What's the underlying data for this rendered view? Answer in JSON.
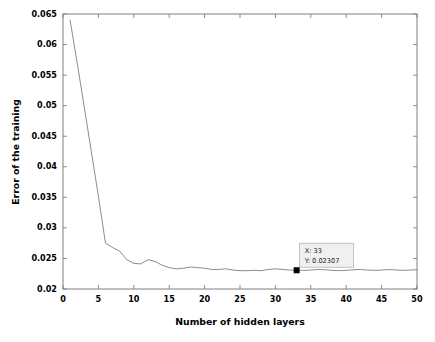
{
  "figure": {
    "background": "#ffffff",
    "plot_box": {
      "left": 63,
      "top": 14,
      "right": 417,
      "bottom": 289
    },
    "axis_color": "#808080",
    "line_color": "#8c8c8c",
    "marker_color": "#000000"
  },
  "datatip": {
    "x_label": "X: 33",
    "y_label": "Y: 0.02307",
    "box_fill": "#f0f0f0",
    "box_border": "#b4b4b4",
    "point_x": 33,
    "point_y": 0.02307
  },
  "chart_data": {
    "type": "line",
    "title": "",
    "xlabel": "Number of hidden layers",
    "ylabel": "Error of the training",
    "xlim": [
      0,
      50
    ],
    "ylim": [
      0.02,
      0.065
    ],
    "xticks": [
      0,
      5,
      10,
      15,
      20,
      25,
      30,
      35,
      40,
      45,
      50
    ],
    "xtick_labels": [
      "0",
      "5",
      "10",
      "15",
      "20",
      "25",
      "30",
      "35",
      "40",
      "45",
      "50"
    ],
    "yticks": [
      0.02,
      0.025,
      0.03,
      0.035,
      0.04,
      0.045,
      0.05,
      0.055,
      0.06,
      0.065
    ],
    "ytick_labels": [
      "0.02",
      "0.025",
      "0.03",
      "0.035",
      "0.04",
      "0.045",
      "0.05",
      "0.055",
      "0.06",
      "0.065"
    ],
    "grid": false,
    "legend": null,
    "series": [
      {
        "name": "training error",
        "color": "#8c8c8c",
        "x": [
          1,
          2,
          3,
          4,
          5,
          6,
          7,
          8,
          9,
          10,
          11,
          12,
          13,
          14,
          15,
          16,
          17,
          18,
          19,
          20,
          21,
          22,
          23,
          24,
          25,
          26,
          27,
          28,
          29,
          30,
          31,
          32,
          33,
          34,
          35,
          36,
          37,
          38,
          39,
          40,
          41,
          42,
          43,
          44,
          45,
          46,
          47,
          48,
          49,
          50
        ],
        "y": [
          0.064,
          0.057,
          0.0498,
          0.0425,
          0.0352,
          0.0275,
          0.0268,
          0.0262,
          0.0248,
          0.0242,
          0.0241,
          0.0248,
          0.0245,
          0.0239,
          0.0235,
          0.0233,
          0.0234,
          0.0236,
          0.0235,
          0.0234,
          0.0232,
          0.0232,
          0.0233,
          0.0231,
          0.023,
          0.023,
          0.02305,
          0.023,
          0.0232,
          0.0233,
          0.0232,
          0.0231,
          0.02307,
          0.02305,
          0.0231,
          0.0232,
          0.02315,
          0.02305,
          0.023,
          0.02305,
          0.02315,
          0.0232,
          0.0231,
          0.02305,
          0.0231,
          0.02318,
          0.02312,
          0.02305,
          0.0231,
          0.02315
        ]
      }
    ],
    "annotations": [
      {
        "name": "data-tip",
        "x": 33,
        "y": 0.02307,
        "text": "X: 33 / Y: 0.02307"
      }
    ]
  }
}
